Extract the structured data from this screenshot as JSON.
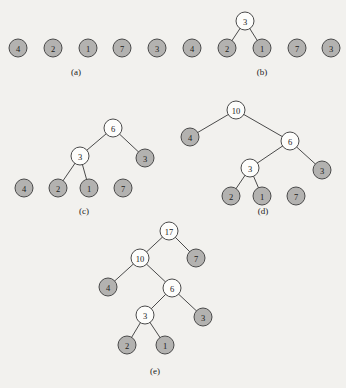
{
  "figure": {
    "background_color": "#f2f1ee",
    "node_fill_gray": "#b3b2b0",
    "node_fill_white": "#fdfdfb",
    "node_stroke": "#4a4a4a",
    "node_radius": 9
  },
  "panels": [
    {
      "id": "a",
      "caption": "(a)",
      "caption_x": 76,
      "caption_y": 72,
      "nodes": [
        {
          "label": "4",
          "x": 18,
          "y": 48,
          "fill": "gray"
        },
        {
          "label": "2",
          "x": 53,
          "y": 48,
          "fill": "gray"
        },
        {
          "label": "1",
          "x": 88,
          "y": 48,
          "fill": "gray"
        },
        {
          "label": "7",
          "x": 122,
          "y": 48,
          "fill": "gray"
        },
        {
          "label": "3",
          "x": 157,
          "y": 48,
          "fill": "gray"
        }
      ],
      "edges": []
    },
    {
      "id": "b",
      "caption": "(b)",
      "caption_x": 262,
      "caption_y": 72,
      "nodes": [
        {
          "label": "3",
          "x": 245,
          "y": 21,
          "fill": "white"
        },
        {
          "label": "4",
          "x": 192,
          "y": 48,
          "fill": "gray"
        },
        {
          "label": "2",
          "x": 227,
          "y": 48,
          "fill": "gray"
        },
        {
          "label": "1",
          "x": 262,
          "y": 48,
          "fill": "gray"
        },
        {
          "label": "7",
          "x": 297,
          "y": 48,
          "fill": "gray"
        },
        {
          "label": "3",
          "x": 331,
          "y": 48,
          "fill": "gray"
        }
      ],
      "edges": [
        {
          "x1": 245,
          "y1": 21,
          "x2": 227,
          "y2": 48
        },
        {
          "x1": 245,
          "y1": 21,
          "x2": 262,
          "y2": 48
        }
      ]
    },
    {
      "id": "c",
      "caption": "(c)",
      "caption_x": 84,
      "caption_y": 211,
      "nodes": [
        {
          "label": "6",
          "x": 113,
          "y": 128,
          "fill": "white"
        },
        {
          "label": "3",
          "x": 80,
          "y": 156,
          "fill": "white"
        },
        {
          "label": "3",
          "x": 145,
          "y": 158,
          "fill": "gray"
        },
        {
          "label": "4",
          "x": 24,
          "y": 188,
          "fill": "gray"
        },
        {
          "label": "2",
          "x": 58,
          "y": 188,
          "fill": "gray"
        },
        {
          "label": "1",
          "x": 89,
          "y": 188,
          "fill": "gray"
        },
        {
          "label": "7",
          "x": 123,
          "y": 188,
          "fill": "gray"
        }
      ],
      "edges": [
        {
          "x1": 113,
          "y1": 128,
          "x2": 80,
          "y2": 156
        },
        {
          "x1": 113,
          "y1": 128,
          "x2": 145,
          "y2": 158
        },
        {
          "x1": 80,
          "y1": 156,
          "x2": 58,
          "y2": 188
        },
        {
          "x1": 80,
          "y1": 156,
          "x2": 89,
          "y2": 188
        }
      ]
    },
    {
      "id": "d",
      "caption": "(d)",
      "caption_x": 263,
      "caption_y": 211,
      "nodes": [
        {
          "label": "10",
          "x": 236,
          "y": 110,
          "fill": "white"
        },
        {
          "label": "4",
          "x": 190,
          "y": 137,
          "fill": "gray"
        },
        {
          "label": "6",
          "x": 290,
          "y": 141,
          "fill": "white"
        },
        {
          "label": "3",
          "x": 250,
          "y": 168,
          "fill": "white"
        },
        {
          "label": "3",
          "x": 322,
          "y": 170,
          "fill": "gray"
        },
        {
          "label": "2",
          "x": 231,
          "y": 196,
          "fill": "gray"
        },
        {
          "label": "1",
          "x": 262,
          "y": 196,
          "fill": "gray"
        },
        {
          "label": "7",
          "x": 296,
          "y": 196,
          "fill": "gray"
        }
      ],
      "edges": [
        {
          "x1": 236,
          "y1": 110,
          "x2": 190,
          "y2": 137
        },
        {
          "x1": 236,
          "y1": 110,
          "x2": 290,
          "y2": 141
        },
        {
          "x1": 290,
          "y1": 141,
          "x2": 250,
          "y2": 168
        },
        {
          "x1": 290,
          "y1": 141,
          "x2": 322,
          "y2": 170
        },
        {
          "x1": 250,
          "y1": 168,
          "x2": 231,
          "y2": 196
        },
        {
          "x1": 250,
          "y1": 168,
          "x2": 262,
          "y2": 196
        }
      ]
    },
    {
      "id": "e",
      "caption": "(e)",
      "caption_x": 155,
      "caption_y": 371,
      "nodes": [
        {
          "label": "17",
          "x": 169,
          "y": 231,
          "fill": "white"
        },
        {
          "label": "10",
          "x": 140,
          "y": 258,
          "fill": "white"
        },
        {
          "label": "7",
          "x": 196,
          "y": 258,
          "fill": "gray"
        },
        {
          "label": "4",
          "x": 108,
          "y": 287,
          "fill": "gray"
        },
        {
          "label": "6",
          "x": 172,
          "y": 288,
          "fill": "white"
        },
        {
          "label": "3",
          "x": 145,
          "y": 315,
          "fill": "white"
        },
        {
          "label": "3",
          "x": 203,
          "y": 317,
          "fill": "gray"
        },
        {
          "label": "2",
          "x": 127,
          "y": 345,
          "fill": "gray"
        },
        {
          "label": "1",
          "x": 165,
          "y": 345,
          "fill": "gray"
        }
      ],
      "edges": [
        {
          "x1": 169,
          "y1": 231,
          "x2": 140,
          "y2": 258
        },
        {
          "x1": 169,
          "y1": 231,
          "x2": 196,
          "y2": 258
        },
        {
          "x1": 140,
          "y1": 258,
          "x2": 108,
          "y2": 287
        },
        {
          "x1": 140,
          "y1": 258,
          "x2": 172,
          "y2": 288
        },
        {
          "x1": 172,
          "y1": 288,
          "x2": 145,
          "y2": 315
        },
        {
          "x1": 172,
          "y1": 288,
          "x2": 203,
          "y2": 317
        },
        {
          "x1": 145,
          "y1": 315,
          "x2": 127,
          "y2": 345
        },
        {
          "x1": 145,
          "y1": 315,
          "x2": 165,
          "y2": 345
        }
      ]
    }
  ]
}
